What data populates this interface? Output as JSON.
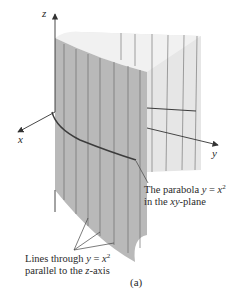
{
  "figure": {
    "caption": "(a)",
    "axes": {
      "x_label": "x",
      "y_label": "y",
      "z_label": "z"
    },
    "annotations": {
      "parabola": {
        "line1_prefix": "The parabola ",
        "line1_var_y": "y",
        "line1_eq": " = ",
        "line1_var_x": "x",
        "line1_exp": "2",
        "line2_prefix": "in the ",
        "line2_plane": "xy",
        "line2_suffix": "-plane"
      },
      "lines": {
        "line1_prefix": "Lines through ",
        "line1_var_y": "y",
        "line1_eq": " = ",
        "line1_var_x": "x",
        "line1_exp": "2",
        "line2_prefix": "parallel to the ",
        "line2_axis": "z",
        "line2_suffix": "-axis"
      }
    },
    "colors": {
      "surface_front": "#b9b9b9",
      "surface_back": "#e6e6e6",
      "surface_top_inner": "#f1f1f1",
      "rulings": "#6e6e6e",
      "curve": "#3c3c3c",
      "axes": "#333333",
      "text": "#2a2a2a"
    }
  }
}
